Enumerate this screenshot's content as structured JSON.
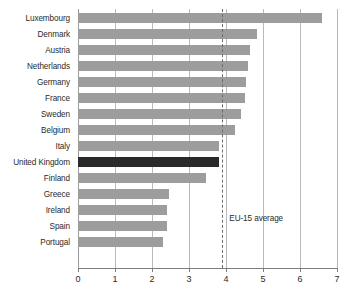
{
  "chart_data": {
    "type": "bar",
    "orientation": "horizontal",
    "title": "",
    "subtitle": "",
    "xlabel": "",
    "ylabel": "",
    "xlim": [
      0,
      7
    ],
    "ylim": null,
    "grid": true,
    "legend_position": "none",
    "categories": [
      "Luxembourg",
      "Denmark",
      "Austria",
      "Netherlands",
      "Germany",
      "France",
      "Sweden",
      "Belgium",
      "Italy",
      "United Kingdom",
      "Finland",
      "Greece",
      "Ireland",
      "Spain",
      "Portugal"
    ],
    "values": [
      6.6,
      4.85,
      4.65,
      4.6,
      4.55,
      4.5,
      4.4,
      4.25,
      3.8,
      3.8,
      3.45,
      2.45,
      2.4,
      2.4,
      2.3
    ],
    "highlight_category": "United Kingdom",
    "xticks": [
      0,
      1,
      2,
      3,
      4,
      5,
      6,
      7
    ],
    "xticklabels": [
      "0",
      "1",
      "2",
      "3",
      "4",
      "5",
      "6",
      "7"
    ],
    "annotations": [
      {
        "name": "eu-15-average",
        "label": "EU-15 average",
        "value": 3.9,
        "style": "dashed-vertical-line"
      }
    ],
    "colors": {
      "bar": "#9d9d9d",
      "bar_highlight": "#2a2a2a",
      "gridline": "#b9b9b9",
      "axis": "#7d7d7d",
      "text": "#2b2b2b",
      "background": "#ffffff",
      "annotation_line": "#6e6e6e"
    }
  }
}
